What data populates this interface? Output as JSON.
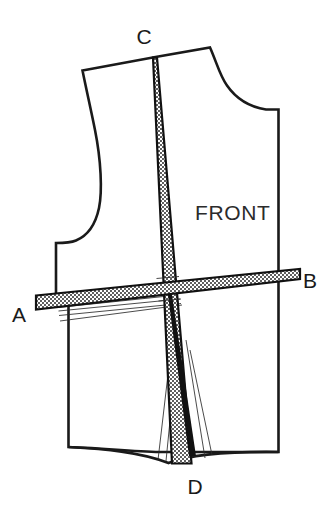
{
  "document": {
    "title": "Sewing Pattern Front Bodice Slash Lines Diagram",
    "type": "technical-line-drawing",
    "background_color": "#ffffff",
    "line_color": "#1a1a1a"
  },
  "figure": {
    "piece_label": "FRONT",
    "stipple_fill_color": "#ffffff",
    "stipple_dot_color": "#1a1a1a",
    "outline_stroke_width": 2.6
  },
  "labels": [
    {
      "id": "A",
      "text": "A",
      "x": 18,
      "y": 318,
      "role": "slash-point-left"
    },
    {
      "id": "B",
      "text": "B",
      "x": 297,
      "y": 288,
      "role": "slash-point-right"
    },
    {
      "id": "C",
      "text": "C",
      "x": 144,
      "y": 46,
      "role": "slash-point-top"
    },
    {
      "id": "D",
      "text": "D",
      "x": 193,
      "y": 486,
      "role": "slash-point-bottom"
    },
    {
      "id": "FRONT",
      "text": "FRONT",
      "x": 195,
      "y": 218,
      "role": "piece-name"
    }
  ],
  "bands": [
    {
      "name": "horizontal-band-AB",
      "from": "A",
      "to": "B",
      "orientation": "horizontal",
      "fill_pattern": "stipple",
      "start_width_px": 14,
      "end_width_px": 9
    },
    {
      "name": "vertical-band-CD",
      "from": "C",
      "to": "D",
      "orientation": "vertical",
      "fill_pattern": "stipple",
      "start_width_px": 2,
      "end_width_px": 22
    }
  ],
  "construction_lines": {
    "count": 5,
    "description": "thin fanned dart/pivot lines radiating from points A and D",
    "stroke_width": 0.85
  }
}
